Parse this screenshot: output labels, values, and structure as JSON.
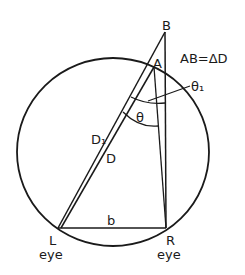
{
  "diagram": {
    "points": {
      "B": "B",
      "A": "A",
      "L": "L",
      "R": "R"
    },
    "labels": {
      "equation": "AB=ΔD",
      "theta": "θ",
      "theta1": "θ₁",
      "D1": "D₁",
      "D": "D",
      "b": "b",
      "left_eye": "eye",
      "right_eye": "eye"
    },
    "colors": {
      "stroke": "#1a1a1a",
      "background": "#ffffff"
    }
  }
}
